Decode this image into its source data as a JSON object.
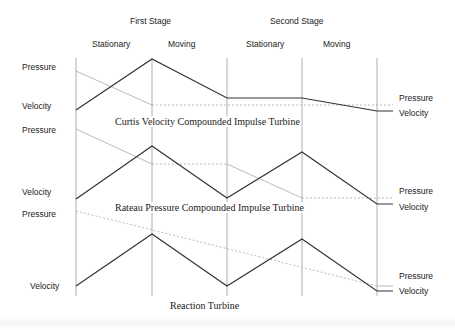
{
  "header": {
    "stage1": "First Stage",
    "stage2": "Second Stage",
    "cols": [
      "Stationary",
      "Moving",
      "Stationary",
      "Moving"
    ]
  },
  "diagrams": [
    {
      "caption": "Curtis Velocity Compounded Impulse Turbine",
      "left_labels": {
        "pressure": "Pressure",
        "velocity": "Velocity"
      },
      "right_labels": {
        "pressure": "Pressure",
        "velocity": "Velocity"
      }
    },
    {
      "caption": "Rateau Pressure Compounded Impulse Turbine",
      "left_labels": {
        "pressure": "Pressure",
        "velocity": "Velocity"
      },
      "right_labels": {
        "pressure": "Pressure",
        "velocity": "Velocity"
      }
    },
    {
      "caption": "Reaction Turbine",
      "left_labels": {
        "pressure": "Pressure",
        "velocity": "Velocity"
      },
      "right_labels": {
        "pressure": "Pressure",
        "velocity": "Velocity"
      }
    }
  ],
  "colors": {
    "velocity_line": "#333333",
    "pressure_line": "#aaaaaa",
    "divider": "#999999"
  }
}
